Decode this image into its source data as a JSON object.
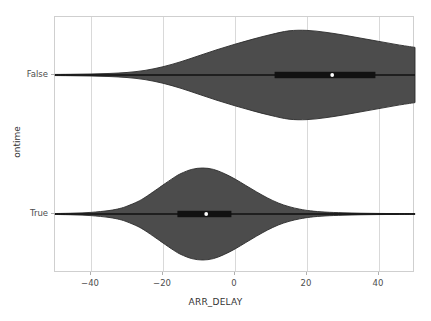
{
  "chart_data": {
    "type": "violin",
    "title": "",
    "xlabel": "ARR_DELAY",
    "ylabel": "ontime",
    "orientation": "horizontal",
    "xlim": [
      -50,
      50
    ],
    "xticks": [
      -40,
      -20,
      0,
      20,
      40
    ],
    "xtick_labels": [
      "−40",
      "−20",
      "0",
      "20",
      "40"
    ],
    "categories": [
      "False",
      "True"
    ],
    "grid": "vertical",
    "legend": "none",
    "violin_fill": "#4c4c4c",
    "violin_edge": "#2b2b2b",
    "box_color": "#111111",
    "median_color": "#ffffff",
    "grid_color": "#d9d9d9",
    "background": "#ffffff",
    "series": [
      {
        "name": "False",
        "category": "False",
        "median": 27,
        "q1": 11,
        "q3": 39,
        "whisker_low": -50,
        "whisker_high": 50,
        "density_peak_x": 16,
        "density": [
          {
            "x": -50,
            "w": 0.012
          },
          {
            "x": -45,
            "w": 0.016
          },
          {
            "x": -40,
            "w": 0.022
          },
          {
            "x": -35,
            "w": 0.033
          },
          {
            "x": -30,
            "w": 0.055
          },
          {
            "x": -25,
            "w": 0.1
          },
          {
            "x": -20,
            "w": 0.18
          },
          {
            "x": -15,
            "w": 0.29
          },
          {
            "x": -10,
            "w": 0.42
          },
          {
            "x": -5,
            "w": 0.55
          },
          {
            "x": 0,
            "w": 0.67
          },
          {
            "x": 5,
            "w": 0.78
          },
          {
            "x": 10,
            "w": 0.88
          },
          {
            "x": 15,
            "w": 0.96
          },
          {
            "x": 20,
            "w": 0.97
          },
          {
            "x": 25,
            "w": 0.93
          },
          {
            "x": 30,
            "w": 0.87
          },
          {
            "x": 35,
            "w": 0.8
          },
          {
            "x": 40,
            "w": 0.73
          },
          {
            "x": 45,
            "w": 0.66
          },
          {
            "x": 50,
            "w": 0.6
          }
        ]
      },
      {
        "name": "True",
        "category": "True",
        "median": -8,
        "q1": -16,
        "q3": -1,
        "whisker_low": -50,
        "whisker_high": 50,
        "density_peak_x": -9,
        "density": [
          {
            "x": -50,
            "w": 0.01
          },
          {
            "x": -45,
            "w": 0.018
          },
          {
            "x": -40,
            "w": 0.035
          },
          {
            "x": -35,
            "w": 0.075
          },
          {
            "x": -32,
            "w": 0.12
          },
          {
            "x": -30,
            "w": 0.17
          },
          {
            "x": -27,
            "w": 0.27
          },
          {
            "x": -25,
            "w": 0.36
          },
          {
            "x": -22,
            "w": 0.52
          },
          {
            "x": -20,
            "w": 0.63
          },
          {
            "x": -17,
            "w": 0.79
          },
          {
            "x": -15,
            "w": 0.88
          },
          {
            "x": -12,
            "w": 0.97
          },
          {
            "x": -9,
            "w": 1.0
          },
          {
            "x": -6,
            "w": 0.97
          },
          {
            "x": -3,
            "w": 0.88
          },
          {
            "x": 0,
            "w": 0.76
          },
          {
            "x": 3,
            "w": 0.62
          },
          {
            "x": 6,
            "w": 0.48
          },
          {
            "x": 9,
            "w": 0.35
          },
          {
            "x": 12,
            "w": 0.24
          },
          {
            "x": 15,
            "w": 0.16
          },
          {
            "x": 18,
            "w": 0.105
          },
          {
            "x": 21,
            "w": 0.068
          },
          {
            "x": 25,
            "w": 0.042
          },
          {
            "x": 30,
            "w": 0.026
          },
          {
            "x": 35,
            "w": 0.017
          },
          {
            "x": 40,
            "w": 0.012
          },
          {
            "x": 45,
            "w": 0.009
          },
          {
            "x": 50,
            "w": 0.007
          }
        ]
      }
    ]
  }
}
